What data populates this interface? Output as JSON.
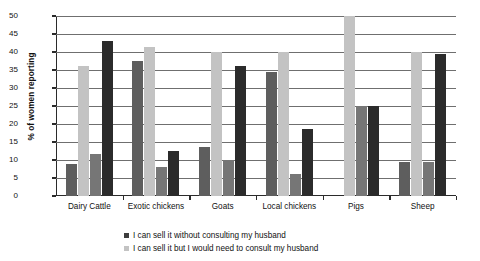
{
  "chart_data": {
    "type": "bar",
    "title": "",
    "subtitle": "",
    "xlabel": "",
    "ylabel": "% of women reporting",
    "ylim": [
      0,
      50
    ],
    "ytick_values": [
      0,
      5,
      10,
      15,
      20,
      25,
      30,
      35,
      40,
      45,
      50
    ],
    "ytick_labels": [
      "0",
      "5",
      "10",
      "15",
      "20",
      "25",
      "30",
      "35",
      "40",
      "45",
      "50"
    ],
    "grid": "horizontal",
    "legend_position": "bottom-center",
    "categories": [
      "Dairy Cattle",
      "Exotic chickens",
      "Goats",
      "Local chickens",
      "Pigs",
      "Sheep"
    ],
    "series": [
      {
        "name": "series-1",
        "label": "",
        "color": "#5e5e5e",
        "values": [
          8.8,
          37.5,
          13.5,
          34.5,
          0,
          9.5
        ]
      },
      {
        "name": "series-2",
        "label": "",
        "color": "#c3c3c3",
        "values": [
          36.2,
          41.5,
          40.0,
          40.0,
          50.0,
          40.0
        ]
      },
      {
        "name": "I can sell it without consulting my husband",
        "label": "I can sell it without consulting my husband",
        "color": "#767676",
        "values": [
          11.7,
          8.0,
          10.0,
          6.0,
          25.0,
          9.5
        ]
      },
      {
        "name": "I can sell it but I would need to consult my husband",
        "label": "I can sell it but I would need to consult my husband",
        "color": "#2b2b2b",
        "values": [
          43.0,
          12.4,
          36.0,
          18.5,
          25.0,
          39.5
        ]
      }
    ],
    "legend_entries": [
      {
        "label": "I can sell it without consulting my husband",
        "color": "#3d3d3d"
      },
      {
        "label": "I can sell it but I would need to consult my husband",
        "color": "#c3c3c3"
      }
    ]
  }
}
